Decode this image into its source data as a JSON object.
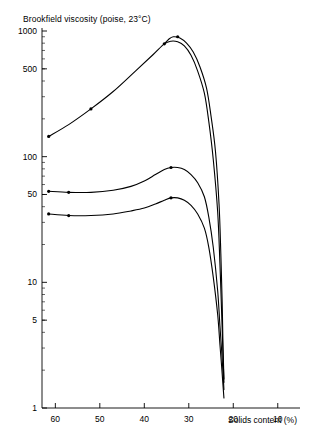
{
  "chart_data": {
    "type": "line",
    "title": "Brookfield viscosity (poise, 23°C)",
    "xlabel": "Solids content (%)",
    "ylabel": "Brookfield viscosity (poise, 23°C)",
    "yscale": "log",
    "ylim": [
      1,
      1000
    ],
    "xlim": [
      63,
      5
    ],
    "x_reversed": true,
    "grid": false,
    "legend": false,
    "ytick_labels": [
      "1000",
      "500",
      "100",
      "50",
      "10",
      "5",
      "1"
    ],
    "ytick_values": [
      1000,
      500,
      100,
      50,
      10,
      5,
      1
    ],
    "xtick_labels": [
      "60",
      "50",
      "40",
      "30",
      "20",
      "10"
    ],
    "xtick_values": [
      60,
      50,
      40,
      30,
      20,
      10
    ],
    "minor_ticks": "log decades 2-9",
    "series": [
      {
        "name": "curve-1-upper",
        "color": "#000000",
        "x": [
          61.5,
          57,
          52,
          47,
          42,
          38,
          35.5,
          34,
          32.5,
          31,
          29.5,
          28,
          26.5,
          25.5,
          24.5,
          23.5,
          23,
          22.6,
          22.3,
          22.1
        ],
        "y": [
          145,
          180,
          240,
          330,
          480,
          650,
          790,
          830,
          820,
          760,
          640,
          480,
          320,
          190,
          95,
          36,
          14,
          5.5,
          2.6,
          1.6
        ]
      },
      {
        "name": "curve-2-upper-overlap",
        "color": "#000000",
        "x": [
          35.5,
          34.5,
          33.5,
          32,
          30.5,
          29,
          27.5,
          26,
          25,
          24,
          23.2,
          22.8,
          22.5,
          22.3,
          22.1
        ],
        "y": [
          790,
          860,
          900,
          880,
          800,
          680,
          520,
          350,
          210,
          110,
          42,
          17,
          7,
          3,
          1.7
        ]
      },
      {
        "name": "curve-3-middle",
        "color": "#000000",
        "x": [
          61.5,
          57,
          52,
          47,
          43,
          40,
          37.5,
          35.5,
          34,
          32.5,
          31,
          29.5,
          28,
          26.5,
          25.5,
          24.5,
          23.5,
          23,
          22.6,
          22.3,
          22.1
        ],
        "y": [
          53,
          52,
          52,
          54,
          58,
          64,
          72,
          79,
          82,
          82,
          79,
          72,
          62,
          48,
          33,
          19,
          8.5,
          4.5,
          2.8,
          1.9,
          1.4
        ]
      },
      {
        "name": "curve-4-lower",
        "color": "#000000",
        "x": [
          61.5,
          57,
          52,
          47,
          43,
          40,
          37.5,
          35.5,
          34,
          32.5,
          31,
          29.5,
          28,
          26.5,
          25.5,
          24.5,
          23.5,
          23,
          22.6,
          22.3,
          22.1
        ],
        "y": [
          35,
          34,
          34,
          35,
          37,
          39,
          42,
          45,
          47,
          47,
          45,
          41,
          35,
          27,
          19,
          11,
          5.5,
          3.2,
          2.1,
          1.5,
          1.2
        ]
      }
    ],
    "markers": [
      {
        "series": "curve-1-upper",
        "x": 61.5,
        "y": 145
      },
      {
        "series": "curve-1-upper",
        "x": 52,
        "y": 240
      },
      {
        "series": "curve-1-upper",
        "x": 35.5,
        "y": 790
      },
      {
        "series": "curve-2-upper-overlap",
        "x": 32.5,
        "y": 900
      },
      {
        "series": "curve-3-middle",
        "x": 61.5,
        "y": 53
      },
      {
        "series": "curve-3-middle",
        "x": 57,
        "y": 52
      },
      {
        "series": "curve-3-middle",
        "x": 34,
        "y": 82
      },
      {
        "series": "curve-4-lower",
        "x": 61.5,
        "y": 35
      },
      {
        "series": "curve-4-lower",
        "x": 57,
        "y": 34
      },
      {
        "series": "curve-4-lower",
        "x": 34,
        "y": 47
      }
    ]
  },
  "axes": {
    "y_axis_name": "viscosity-axis",
    "x_axis_name": "solids-content-axis"
  }
}
